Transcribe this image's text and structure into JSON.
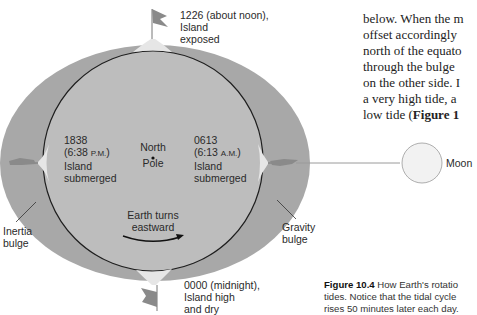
{
  "body_text": {
    "lines": [
      "rises approximately 50 minutes",
      "below. When the m",
      "offset accordingly",
      "north of the equato",
      "through the bulge",
      "on the other side. I",
      "a very high tide, a",
      "low tide ("
    ],
    "last_line_bold": "Figure 1"
  },
  "figure": {
    "colors": {
      "bulge_fill": "#a8a8a8",
      "earth_fill": "#bdbdbd",
      "earth_outline": "#1e1e1e",
      "island_fill": "#e6e6e6",
      "moon_fill": "#f2f2f2",
      "moon_outline": "#9a9a9a",
      "text": "#2a2a2a"
    },
    "labels": {
      "noon": {
        "line1": "1226 (about noon),",
        "line2": "Island",
        "line3": "exposed"
      },
      "evening": {
        "line1": "1838",
        "line2_time": "(6:38 ",
        "line2_suffix": "P.M.",
        "line2_close": ")",
        "line3": "Island",
        "line4": "submerged"
      },
      "morning": {
        "line1": "0613",
        "line2_time": "(6:13 ",
        "line2_suffix": "A.M.",
        "line2_close": ")",
        "line3": "Island",
        "line4": "submerged"
      },
      "pole": {
        "line1": "North",
        "line2": "Pole"
      },
      "rotation": {
        "line1": "Earth turns",
        "line2": "eastward"
      },
      "midnight": {
        "line1": "0000 (midnight),",
        "line2": "Island high",
        "line3": "and dry"
      },
      "inertia": {
        "line1": "Inertia",
        "line2": "bulge"
      },
      "gravity": {
        "line1": "Gravity",
        "line2": "bulge"
      },
      "moon": "Moon"
    },
    "caption": {
      "figure_number": "Figure 10.4",
      "line1_rest": " How Earth's rotatio",
      "line2": "tides. Notice that the tidal cycle",
      "line3": "rises 50 minutes later each day."
    }
  }
}
